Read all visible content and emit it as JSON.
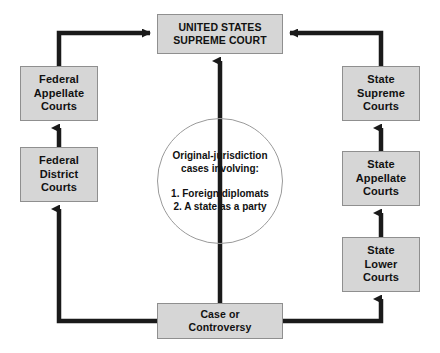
{
  "diagram": {
    "colors": {
      "box_fill": "#d6d6d6",
      "box_border": "#8f8f8f",
      "arrow": "#1a1a1a",
      "circle_border": "#9a9a9a",
      "text": "#111111",
      "background": "#ffffff"
    },
    "nodes": {
      "supreme_court": {
        "lines": [
          "UNITED STATES",
          "SUPREME COURT"
        ]
      },
      "federal_appellate": {
        "lines": [
          "Federal",
          "Appellate",
          "Courts"
        ]
      },
      "federal_district": {
        "lines": [
          "Federal",
          "District",
          "Courts"
        ]
      },
      "state_supreme": {
        "lines": [
          "State",
          "Supreme",
          "Courts"
        ]
      },
      "state_appellate": {
        "lines": [
          "State",
          "Appellate",
          "Courts"
        ]
      },
      "state_lower": {
        "lines": [
          "State",
          "Lower",
          "Courts"
        ]
      },
      "case_controversy": {
        "lines": [
          "Case or",
          "Controversy"
        ]
      },
      "original_jurisdiction": {
        "heading_lines": [
          "Original-jurisdiction",
          "cases involving:"
        ],
        "list_lines": [
          "1. Foreign diplomats",
          "2. A state as a party"
        ]
      }
    },
    "connections": [
      {
        "name": "case-to-federal-district",
        "from": "case_controversy",
        "to": "federal_district",
        "direction": "up"
      },
      {
        "name": "federal-district-to-federal-appellate",
        "from": "federal_district",
        "to": "federal_appellate",
        "direction": "up"
      },
      {
        "name": "federal-appellate-to-supreme-court",
        "from": "federal_appellate",
        "to": "supreme_court",
        "direction": "right"
      },
      {
        "name": "case-to-state-lower",
        "from": "case_controversy",
        "to": "state_lower",
        "direction": "up"
      },
      {
        "name": "state-lower-to-state-appellate",
        "from": "state_lower",
        "to": "state_appellate",
        "direction": "up"
      },
      {
        "name": "state-appellate-to-state-supreme",
        "from": "state_appellate",
        "to": "state_supreme",
        "direction": "up"
      },
      {
        "name": "state-supreme-to-supreme-court",
        "from": "state_supreme",
        "to": "supreme_court",
        "direction": "left"
      },
      {
        "name": "case-to-supreme-court-original-jurisdiction",
        "from": "case_controversy",
        "to": "supreme_court",
        "direction": "up"
      }
    ]
  }
}
